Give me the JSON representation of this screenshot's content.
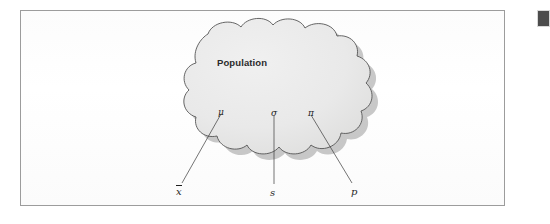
{
  "figure": {
    "type": "statistics-population-sample-diagram",
    "cloud_label": "Population",
    "population_parameters": [
      {
        "symbol": "μ",
        "name": "mu"
      },
      {
        "symbol": "σ",
        "name": "sigma"
      },
      {
        "symbol": "π",
        "name": "pi"
      }
    ],
    "sample_statistics": [
      {
        "symbol": "x",
        "name": "x-bar",
        "has_overbar": true
      },
      {
        "symbol": "s",
        "name": "s",
        "has_overbar": false
      },
      {
        "symbol": "p",
        "name": "p",
        "has_overbar": false
      }
    ],
    "colors": {
      "cloud_fill": "#e8e8e8",
      "cloud_outline": "#555555",
      "cloud_shadow": "#9a9a9a",
      "frame_border": "#9c9c9c",
      "page_background": "#ffffff",
      "text": "#2b2b2b",
      "corner_marker": "#4c4c4c"
    }
  }
}
